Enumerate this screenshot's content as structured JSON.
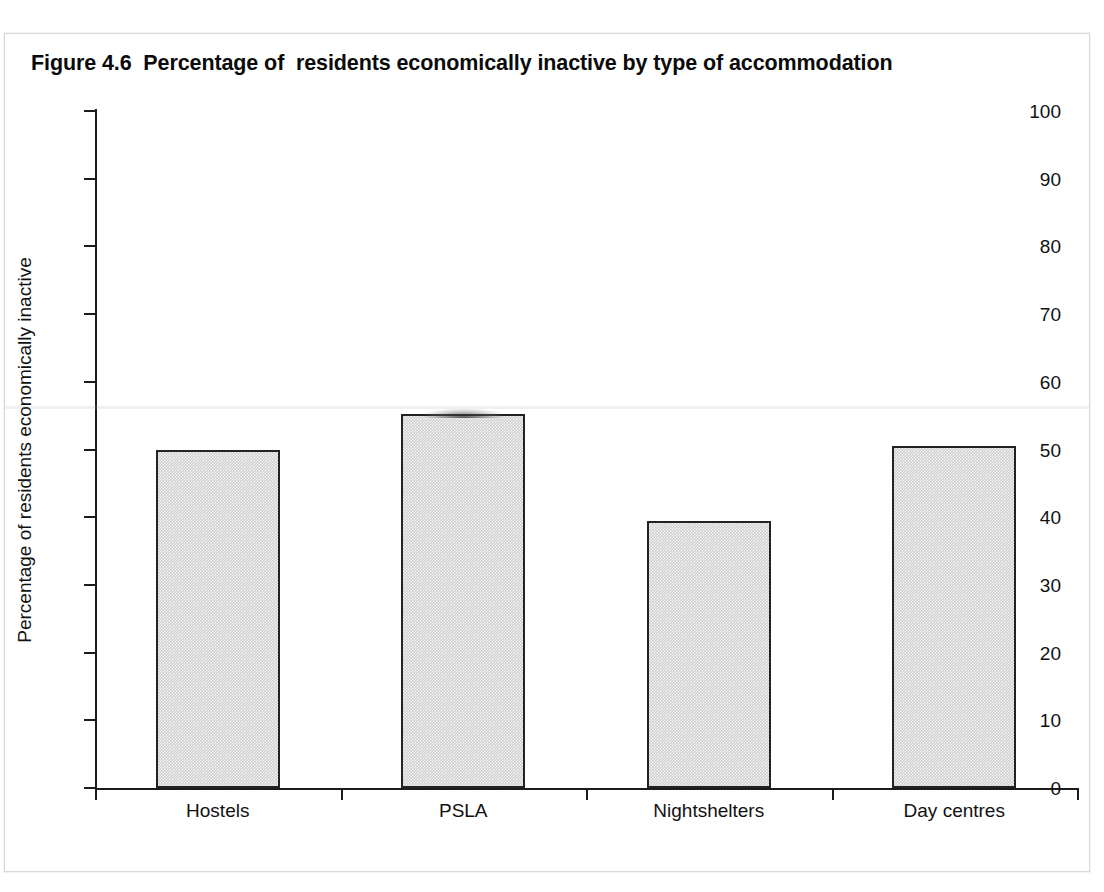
{
  "figure": {
    "title": "Figure 4.6  Percentage of  residents economically inactive by type of accommodation",
    "background_color": "#ffffff",
    "border_color": "#d9d9d9"
  },
  "chart_data": {
    "type": "bar",
    "title": "Figure 4.6  Percentage of  residents economically inactive by type of accommodation",
    "categories": [
      "Hostels",
      "PSLA",
      "Nightshelters",
      "Day centres"
    ],
    "values": [
      50.0,
      55.2,
      39.5,
      50.5
    ],
    "xlabel": "",
    "ylabel": "Percentage of residents economically inactive",
    "ylim": [
      0,
      100
    ],
    "ytick_step": 10,
    "yticks": [
      100,
      90,
      80,
      70,
      60,
      50,
      40,
      30,
      20,
      10,
      0
    ],
    "ytick_labels": [
      "100",
      "90",
      "80",
      "70",
      "60",
      "50",
      "40",
      "30",
      "20",
      "10",
      "0"
    ],
    "grid": false,
    "legend": null,
    "bar_fill_color": "#cfcfcf",
    "bar_edge_color": "#222222",
    "axis_color": "#1c1c1c"
  }
}
